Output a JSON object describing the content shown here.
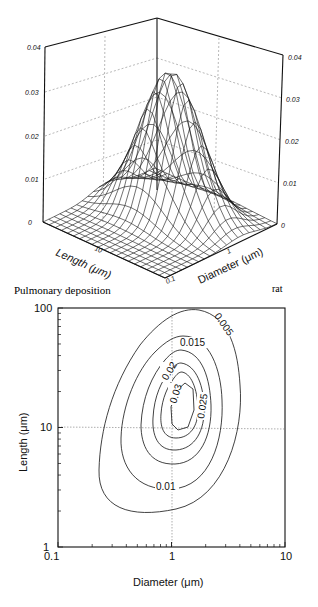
{
  "figure": {
    "caption_left": "Pulmonary deposition",
    "caption_right": "rat"
  },
  "chart_data": [
    {
      "type": "surface3d",
      "title": "",
      "xlabel": "Length (μm)",
      "ylabel": "Diameter (μm)",
      "zlabel": "",
      "z_ticks": [
        "0",
        "0.01",
        "0.02",
        "0.03",
        "0.04"
      ],
      "zlim": [
        0,
        0.04
      ],
      "length_axis_ticks": [
        "10"
      ],
      "diameter_axis_ticks": [
        "0.1",
        "1"
      ],
      "peak": {
        "length_um": 15,
        "diameter_um": 1.3,
        "value": 0.033
      },
      "grid": true
    },
    {
      "type": "contour",
      "title": "",
      "xlabel": "Diameter (μm)",
      "ylabel": "Length (μm)",
      "x_scale": "log",
      "y_scale": "log",
      "xlim": [
        0.1,
        10
      ],
      "ylim": [
        1,
        100
      ],
      "x_ticks": [
        "0.1",
        "1",
        "10"
      ],
      "y_ticks": [
        "1",
        "10",
        "100"
      ],
      "levels": [
        0.005,
        0.01,
        0.015,
        0.02,
        0.025,
        0.03
      ],
      "level_labels": [
        "0.005",
        "0.01",
        "0.015",
        "0.02",
        "0.025",
        "0.03"
      ],
      "reference_lines": {
        "x": 1,
        "y": 10
      },
      "peak": {
        "diameter_um": 1.3,
        "length_um": 15,
        "value": 0.033
      }
    }
  ],
  "labels3d": {
    "z_left": [
      "0",
      "0.01",
      "0.02",
      "0.03",
      "0.04"
    ],
    "z_right": [
      "0",
      "0.01",
      "0.02",
      "0.03",
      "0.04"
    ],
    "length_axis": "Length (μm)",
    "diameter_axis": "Diameter (μm)",
    "len_tick": "10",
    "dia_tick_1": "1",
    "dia_tick_01": "0.1"
  },
  "labels2d": {
    "x_ticks": [
      "0.1",
      "1",
      "10"
    ],
    "y_ticks": [
      "1",
      "10",
      "100"
    ],
    "xlabel": "Diameter (μm)",
    "ylabel": "Length (μm)",
    "contour_labels": {
      "c005": "0.005",
      "c01": "0.01",
      "c015": "0.015",
      "c02": "0.02",
      "c025": "0.025",
      "c03": "0.03"
    }
  }
}
